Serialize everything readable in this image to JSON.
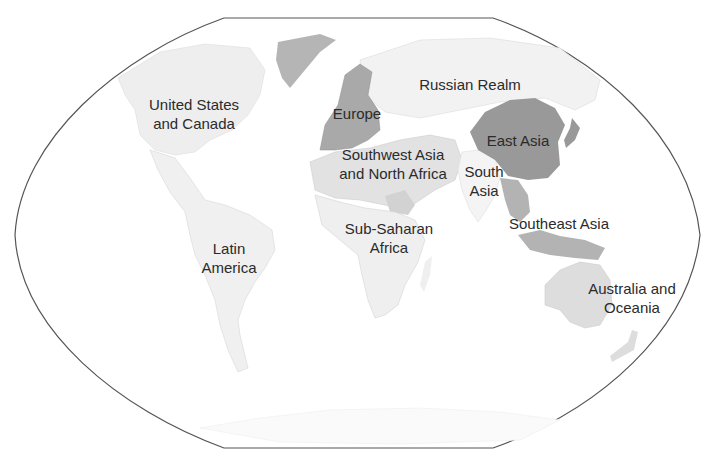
{
  "map": {
    "projection": "winkel-tripel-like (flat poles)",
    "colors": {
      "background": "#ffffff",
      "ocean": "#ffffff",
      "outline": "#555555",
      "light_region": "#eeeeee",
      "medium_region": "#d9d9d9",
      "mid_dark_region": "#b8b8b8",
      "dark_region": "#999999",
      "border_lines": "#cfcfcf"
    },
    "regions": [
      {
        "name": "United States and Canada",
        "line1": "United States",
        "line2": "and Canada",
        "shade": "#eeeeee"
      },
      {
        "name": "Europe",
        "line1": "Europe",
        "line2": "",
        "shade": "#a9a9a9"
      },
      {
        "name": "Russian Realm",
        "line1": "Russian Realm",
        "line2": "",
        "shade": "#f2f2f2"
      },
      {
        "name": "East Asia",
        "line1": "East Asia",
        "line2": "",
        "shade": "#999999"
      },
      {
        "name": "Southwest Asia and North Africa",
        "line1": "Southwest Asia",
        "line2": "and North Africa",
        "shade": "#e2e2e2"
      },
      {
        "name": "South Asia",
        "line1": "South",
        "line2": "Asia",
        "shade": "#f4f4f4"
      },
      {
        "name": "Southeast Asia",
        "line1": "Southeast Asia",
        "line2": "",
        "shade": "#b3b3b3"
      },
      {
        "name": "Sub-Saharan Africa",
        "line1": "Sub-Saharan",
        "line2": "Africa",
        "shade": "#efefef"
      },
      {
        "name": "Latin America",
        "line1": "Latin",
        "line2": "America",
        "shade": "#f0f0f0"
      },
      {
        "name": "Australia and Oceania",
        "line1": "Australia and",
        "line2": "Oceania",
        "shade": "#dddddd"
      },
      {
        "name": "Greenland",
        "line1": "",
        "line2": "",
        "shade": "#b5b5b5"
      },
      {
        "name": "Antarctica",
        "line1": "",
        "line2": "",
        "shade": "#fafafa"
      }
    ]
  }
}
